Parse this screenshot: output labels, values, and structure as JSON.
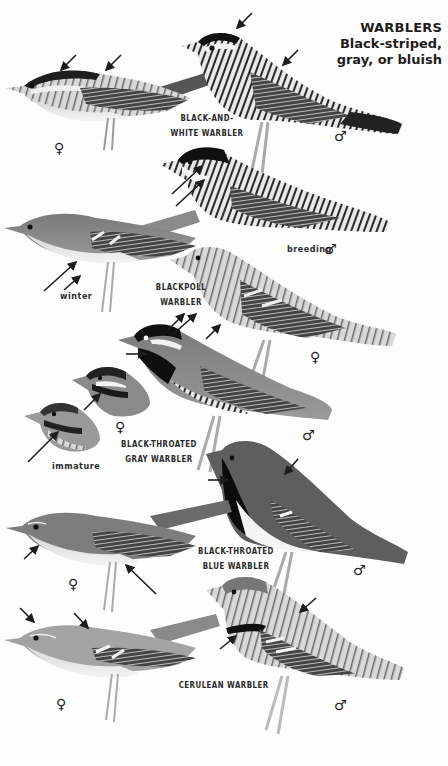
{
  "heading": {
    "title": "WARBLERS",
    "subtitle_line1": "Black-striped,",
    "subtitle_line2": "gray, or bluish"
  },
  "species": [
    {
      "name_line1": "BLACK-AND-",
      "name_line2": "WHITE WARBLER",
      "plumages": [
        {
          "sex_symbol": "♀",
          "sex": "female"
        },
        {
          "sex_symbol": "♂",
          "sex": "male"
        }
      ]
    },
    {
      "name_line1": "BLACKPOLL",
      "name_line2": "WARBLER",
      "plumages": [
        {
          "note": "breeding",
          "sex_symbol": "♂",
          "sex": "male"
        },
        {
          "note": "winter"
        },
        {
          "sex_symbol": "♀",
          "sex": "female"
        }
      ]
    },
    {
      "name_line1": "BLACK-THROATED",
      "name_line2": "GRAY WARBLER",
      "plumages": [
        {
          "sex_symbol": "♂",
          "sex": "male"
        },
        {
          "sex_symbol": "♀",
          "sex": "female"
        },
        {
          "note": "immature"
        }
      ]
    },
    {
      "name_line1": "BLACK-THROATED",
      "name_line2": "BLUE WARBLER",
      "plumages": [
        {
          "sex_symbol": "♂",
          "sex": "male"
        },
        {
          "sex_symbol": "♀",
          "sex": "female"
        }
      ]
    },
    {
      "name_line1": "CERULEAN WARBLER",
      "plumages": [
        {
          "sex_symbol": "♂",
          "sex": "male"
        },
        {
          "sex_symbol": "♀",
          "sex": "female"
        }
      ]
    }
  ],
  "colors": {
    "background": "#fdfdfd",
    "ink": "#1d1d1d",
    "plumage_dark": "#1a1a1a",
    "plumage_mid": "#6e6e6e",
    "plumage_light": "#b8b8b8",
    "plumage_pale": "#ececec"
  }
}
